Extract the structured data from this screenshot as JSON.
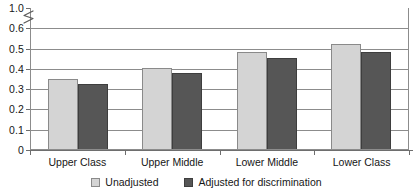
{
  "chart_data": {
    "type": "bar",
    "title": "",
    "subtitle": "",
    "xlabel": "",
    "ylabel": "",
    "categories": [
      "Upper Class",
      "Upper Middle",
      "Lower Middle",
      "Lower Class"
    ],
    "series": [
      {
        "name": "Unadjusted",
        "color": "#d4d4d4",
        "values": [
          0.345,
          0.4,
          0.48,
          0.52
        ]
      },
      {
        "name": "Adjusted for discrimination",
        "color": "#565656",
        "values": [
          0.32,
          0.375,
          0.45,
          0.48
        ]
      }
    ],
    "ylim": [
      0,
      0.6
    ],
    "y_ticks": [
      0,
      0.1,
      0.2,
      0.3,
      0.4,
      0.5,
      0.6,
      1.0
    ],
    "y_tick_labels": [
      "0",
      "0.1",
      "0.2",
      "0.3",
      "0.4",
      "0.5",
      "0.6",
      "1.0"
    ],
    "axis_break": {
      "present": true,
      "between": [
        0.6,
        1.0
      ],
      "symbol": "zigzag"
    },
    "grid": true,
    "grid_orientation": "horizontal",
    "legend_position": "bottom",
    "bar_orientation": "vertical",
    "group_mode": "clustered"
  },
  "axis": {
    "y_labels": [
      "1.0",
      "0.6",
      "0.5",
      "0.4",
      "0.3",
      "0.2",
      "0.1",
      "0"
    ],
    "x_labels": [
      "Upper Class",
      "Upper Middle",
      "Lower Middle",
      "Lower Class"
    ]
  },
  "legend": {
    "entries": [
      {
        "label": "Unadjusted",
        "swatch": "light-gray-swatch"
      },
      {
        "label": "Adjusted for discrimination",
        "swatch": "dark-gray-swatch"
      }
    ]
  },
  "colors": {
    "series_unadjusted": "#d4d4d4",
    "series_adjusted": "#565656",
    "gridline": "#8c8c8c",
    "axis": "#6e6e6e",
    "text": "#161616",
    "background": "#ffffff"
  }
}
